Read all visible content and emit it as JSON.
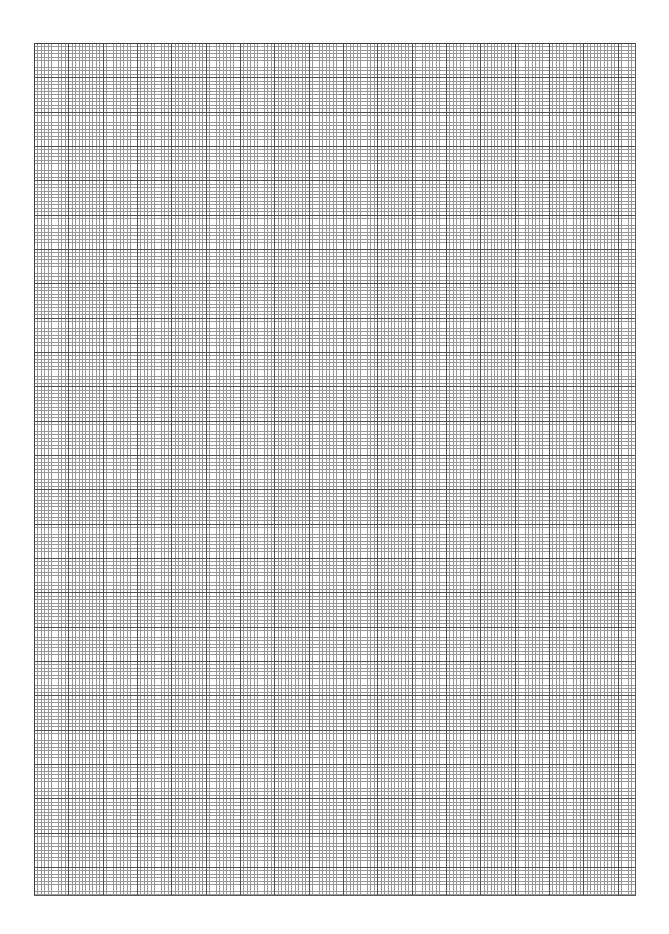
{
  "page": {
    "width_px": 669,
    "height_px": 934,
    "background_color": "#ffffff",
    "visible_text": "",
    "notes_label": ""
  },
  "grid": {
    "label": "graph-paper-grid",
    "region": {
      "left_px": 34,
      "top_px": 43,
      "width_px": 602,
      "height_px": 853
    },
    "fine": {
      "label": "minor-gridline",
      "spacing_px": 3.4333,
      "color": "#979797",
      "line_width_px": 0.9
    },
    "major": {
      "label": "major-gridline",
      "spacing_px": 34.333,
      "fine_cells_per_major": 10,
      "color": "#4f4f4f",
      "line_width_px": 1.1
    },
    "border": {
      "label": "grid-border",
      "top_color": "#3f3f3f",
      "left_color": "#3f3f3f",
      "right_color": "#5a5a5a",
      "bottom_color": "#5a5a5a"
    },
    "counts": {
      "major_columns": "17.5",
      "major_rows": "25",
      "fine_columns": "175",
      "fine_rows": "248"
    }
  },
  "chart_data": {
    "type": "table",
    "title": "",
    "xlabel": "",
    "ylabel": "",
    "categories": [],
    "values": [],
    "grid": "on",
    "legend": "none",
    "annotations": []
  }
}
